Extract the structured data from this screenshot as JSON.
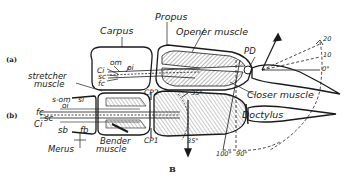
{
  "figure": {
    "letter": "B",
    "panels": [
      {
        "id": "a",
        "label": "(a)"
      },
      {
        "id": "b",
        "label": "(b)"
      }
    ]
  },
  "labels": {
    "carpus": "Carpus",
    "propus": "Propus",
    "opener_muscle": "Opener muscle",
    "pd": "PD",
    "closer_muscle": "Closer muscle",
    "stretcher_muscle_line1": "stretcher",
    "stretcher_muscle_line2": "muscle",
    "om": "om",
    "oi": "oi",
    "ci_a": "Ci",
    "sc_a": "sc",
    "fc_a": "fc",
    "s_om": "s-om",
    "si": "si",
    "oi_b": "oi",
    "fc_b": "fc",
    "sc_b": "sc",
    "ci_b": "Ci",
    "sb": "sb",
    "fb": "fb",
    "merus": "Merus",
    "bender_muscle_line1": "Bender",
    "bender_muscle_line2": "muscle",
    "cp2": "CP2",
    "cp1": "CP1",
    "dactylus": "Doctylus"
  },
  "angles": {
    "deg_20": "20",
    "deg_10": "10",
    "deg_0": "0°",
    "deg_35_top": "35°",
    "deg_35_bottom": "35°",
    "deg_100": "100°",
    "deg_90": "90°"
  },
  "colors": {
    "ink": "#1a1a1a",
    "background": "#ffffff",
    "hatch": "#555555"
  }
}
